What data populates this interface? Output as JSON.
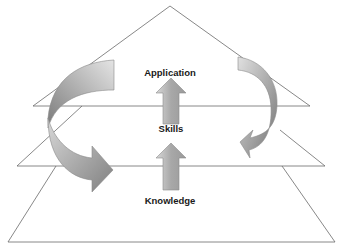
{
  "diagram": {
    "type": "layered-pyramid",
    "layers": [
      {
        "label": "Application",
        "level": "top"
      },
      {
        "label": "Skills",
        "level": "middle"
      },
      {
        "label": "Knowledge",
        "level": "bottom"
      }
    ],
    "arrows": [
      {
        "name": "up-arrow-skills-to-application",
        "direction": "up"
      },
      {
        "name": "up-arrow-knowledge-to-skills",
        "direction": "up"
      },
      {
        "name": "curved-arrow-left",
        "direction": "down-right"
      },
      {
        "name": "curved-arrow-right",
        "direction": "down-left"
      }
    ],
    "colors": {
      "line": "#555555",
      "arrow_dark": "#7a7a7a",
      "arrow_light": "#e0e0e0",
      "text": "#1a1a1a"
    }
  }
}
